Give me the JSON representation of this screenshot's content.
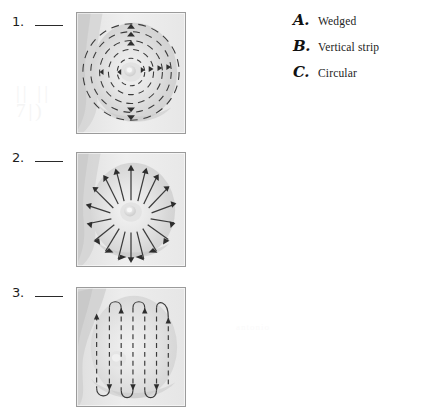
{
  "worksheet": {
    "questions": [
      {
        "number": "1.",
        "answer_blank": "",
        "pattern_shown": "circular",
        "panel_name": "breast-exam-circular-pattern"
      },
      {
        "number": "2.",
        "answer_blank": "",
        "pattern_shown": "wedged",
        "panel_name": "breast-exam-wedged-pattern"
      },
      {
        "number": "3.",
        "answer_blank": "",
        "pattern_shown": "vertical-strip",
        "panel_name": "breast-exam-vertical-strip-pattern"
      }
    ],
    "answer_key": [
      {
        "letter": "A.",
        "label": "Wedged"
      },
      {
        "letter": "B.",
        "label": "Vertical strip"
      },
      {
        "letter": "C.",
        "label": "Circular"
      }
    ],
    "ghost_text": {
      "left_line_1": "|| ||",
      "left_line_2": "7|)",
      "right_mark": "antonio"
    },
    "colors": {
      "page_background": "#ffffff",
      "panel_border": "#9b9b9b",
      "panel_background": "#efefef",
      "arrow_stroke": "#3a3a3a",
      "text": "#1c1c1c"
    }
  }
}
